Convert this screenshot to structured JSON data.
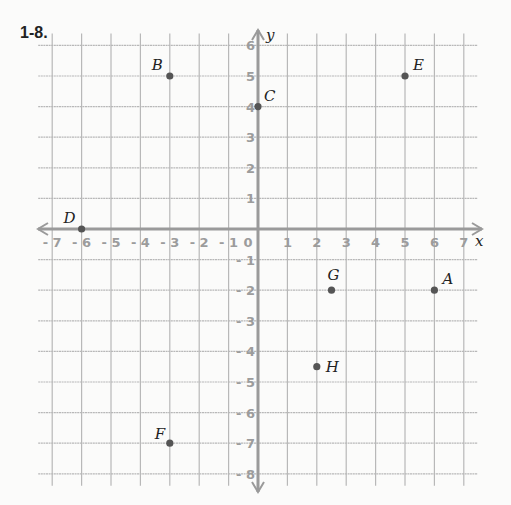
{
  "problem_number": "1-8.",
  "colors": {
    "grid": "#b8b8b8",
    "axis": "#9a9a9a",
    "tick_label": "#9c9c9c",
    "point": "#555555",
    "point_label": "#222222",
    "background": "#fbfbfa"
  },
  "chart_data": {
    "type": "scatter",
    "title": "1-8.",
    "xlabel": "x",
    "ylabel": "y",
    "xlim": [
      -7,
      7
    ],
    "ylim": [
      -8,
      6
    ],
    "grid": true,
    "x_ticks": [
      -7,
      -6,
      -5,
      -4,
      -3,
      -2,
      -1,
      0,
      1,
      2,
      3,
      4,
      5,
      6,
      7
    ],
    "y_ticks": [
      -8,
      -7,
      -6,
      -5,
      -4,
      -3,
      -2,
      -1,
      1,
      2,
      3,
      4,
      5,
      6
    ],
    "points": [
      {
        "label": "A",
        "x": 6,
        "y": -2
      },
      {
        "label": "B",
        "x": -3,
        "y": 5
      },
      {
        "label": "C",
        "x": 0,
        "y": 4
      },
      {
        "label": "D",
        "x": -6,
        "y": 0
      },
      {
        "label": "E",
        "x": 5,
        "y": 5
      },
      {
        "label": "F",
        "x": -3,
        "y": -7
      },
      {
        "label": "G",
        "x": 2.5,
        "y": -2
      },
      {
        "label": "H",
        "x": 2,
        "y": -4.5
      }
    ]
  }
}
